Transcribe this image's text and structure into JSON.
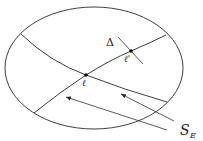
{
  "diagram": {
    "type": "geometric-figure",
    "labels": {
      "delta": "Δ",
      "point_l": "ℓ",
      "point_l_prime": "ℓ'",
      "set_main": "S",
      "set_sub": "E"
    },
    "colors": {
      "stroke": "#2b2b2b",
      "background": "#ffffff"
    }
  }
}
